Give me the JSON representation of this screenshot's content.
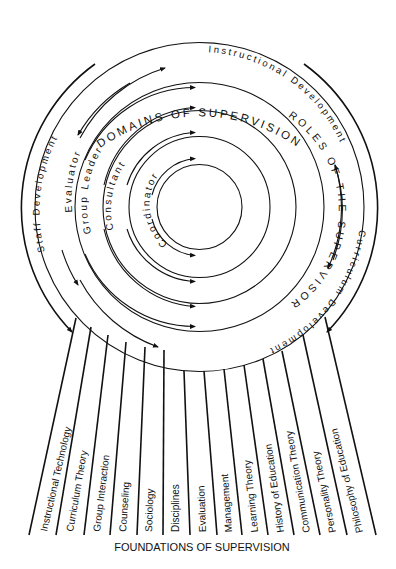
{
  "diagram": {
    "outer_title": "DOMAINS OF SUPERVISION",
    "domains": {
      "top": "Instructional Development",
      "left": "Staff Development",
      "right_bottom": "Curriculum Development"
    },
    "roles_title": "ROLES OF THE SUPERVISOR",
    "roles": [
      "Evaluator",
      "Group Leader",
      "Consultant",
      "Coordinator"
    ],
    "foundations": [
      "Instructional Technology",
      "Curriculum Theory",
      "Group Interaction",
      "Counseling",
      "Sociology",
      "Disciplines",
      "Evaluation",
      "Management",
      "Learning Theory",
      "History of Education",
      "Communication Theory",
      "Personality Theory",
      "Philosophy of Education"
    ],
    "footer": "FOUNDATIONS OF SUPERVISION",
    "line_color": "#111111",
    "background": "#ffffff"
  }
}
